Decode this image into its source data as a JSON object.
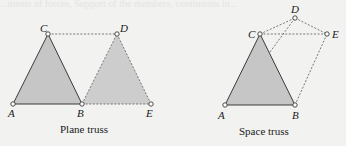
{
  "background_text": {
    "line1": "...ments of forces, Support of the members, continuous in..."
  },
  "plane_truss": {
    "caption": "Plane truss",
    "nodes": {
      "A": {
        "label": "A",
        "x": 13,
        "y": 104
      },
      "B": {
        "label": "B",
        "x": 82,
        "y": 104
      },
      "C": {
        "label": "C",
        "x": 48,
        "y": 34
      },
      "D": {
        "label": "D",
        "x": 117,
        "y": 34
      },
      "E": {
        "label": "E",
        "x": 151,
        "y": 104
      }
    },
    "solid_members": [
      "AB",
      "BC",
      "CA"
    ],
    "dashed_members": [
      "CD",
      "BD",
      "DE",
      "BE"
    ],
    "shaded_regions": [
      "ABC",
      "BDE"
    ]
  },
  "space_truss": {
    "caption": "Space truss",
    "nodes": {
      "A": {
        "label": "A",
        "x": 225,
        "y": 105
      },
      "B": {
        "label": "B",
        "x": 295,
        "y": 105
      },
      "C": {
        "label": "C",
        "x": 260,
        "y": 34
      },
      "D": {
        "label": "D",
        "x": 295,
        "y": 18
      },
      "E": {
        "label": "E",
        "x": 327,
        "y": 34
      }
    },
    "solid_members": [
      "AB",
      "BC",
      "CA"
    ],
    "dashed_members": [
      "CD",
      "CE",
      "DE",
      "BD",
      "BE"
    ],
    "shaded_regions": [
      "ABC"
    ]
  },
  "colors": {
    "background": "#f2f2f1",
    "shade": "#c6c6c6",
    "line": "#3a3a3a"
  }
}
